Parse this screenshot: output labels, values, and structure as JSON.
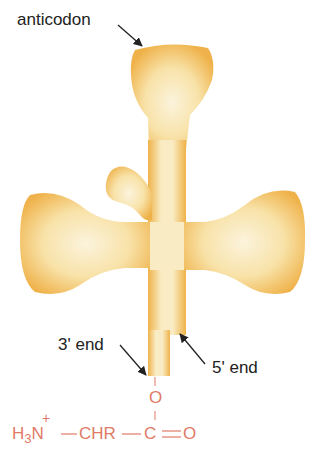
{
  "labels": {
    "anticodon": "anticodon",
    "three_prime": "3' end",
    "five_prime": "5' end"
  },
  "chemistry": {
    "plus": "+",
    "h3n": "H",
    "sub3": "3",
    "n": "N",
    "bond1": "—",
    "chr": "CHR",
    "bond2": "—",
    "c": "C",
    "double_bond": "=",
    "o_carbonyl": "O",
    "o_ester": "O"
  },
  "colors": {
    "trna_edge": "#f0b54a",
    "trna_fill": "#fbf1d2",
    "chem": "#e07a66",
    "text": "#222222"
  }
}
